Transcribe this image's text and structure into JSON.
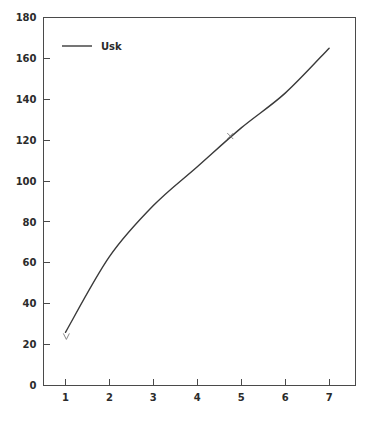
{
  "chart_data": {
    "type": "line",
    "title": "",
    "subtitle": "",
    "xlabel": "",
    "ylabel": "",
    "xlim": [
      0.5,
      7.6
    ],
    "ylim": [
      0,
      180
    ],
    "grid": false,
    "legend_position": "top-left",
    "x_ticks": [
      1,
      2,
      3,
      4,
      5,
      6,
      7
    ],
    "x_tick_labels": [
      "1",
      "2",
      "3",
      "4",
      "5",
      "6",
      "7"
    ],
    "y_ticks": [
      0,
      20,
      40,
      60,
      80,
      100,
      120,
      140,
      160,
      180
    ],
    "y_tick_labels": [
      "0",
      "20",
      "40",
      "60",
      "80",
      "100",
      "120",
      "140",
      "160",
      "180"
    ],
    "series": [
      {
        "name": "Usk",
        "color": "#3a3a3a",
        "x": [
          1,
          2,
          3,
          4,
          5,
          6,
          7
        ],
        "values": [
          26,
          63,
          88,
          107,
          126,
          143,
          165
        ],
        "markers": [
          {
            "x": 4.75,
            "y": 122,
            "glyph": "x"
          },
          {
            "x": 1.02,
            "y": 24,
            "glyph": "v"
          }
        ]
      }
    ],
    "legend": [
      {
        "label": "Usk",
        "color": "#3a3a3a",
        "style": "solid-line"
      }
    ]
  },
  "axes": {
    "axis_color": "#4a4a4a",
    "label_color": "#2b2b2b"
  }
}
